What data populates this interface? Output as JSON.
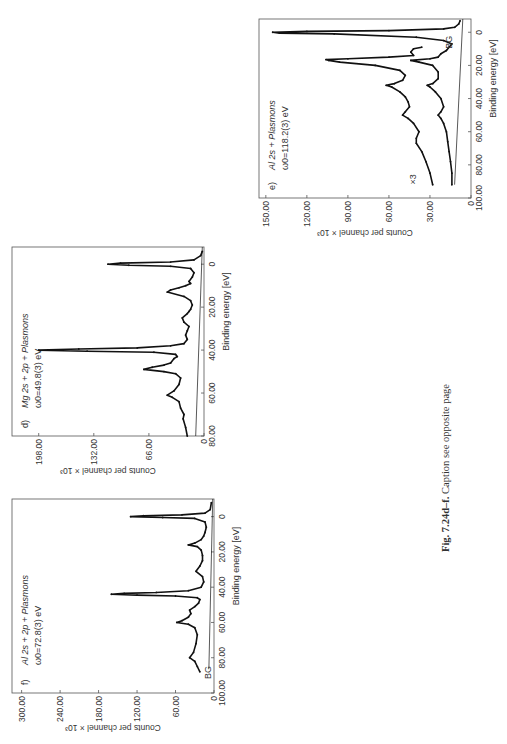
{
  "caption": {
    "prefix": "Fig. 7.24d–f.",
    "text": " Caption see opposite page"
  },
  "chart_data": [
    {
      "id": "d",
      "type": "line",
      "panel_label": "d)",
      "title": "Mg 2s + 2p + Plasmons",
      "subtitle": "ω0=49.8(3) eV",
      "xlabel": "Binding energy [eV]",
      "ylabel": "Counts per channel × 10³",
      "xlim": [
        80,
        -8
      ],
      "ylim": [
        0,
        230
      ],
      "xticks": [
        "80.00",
        "60.00",
        "40.00",
        "20.00",
        "0"
      ],
      "xtick_values": [
        80,
        60,
        40,
        20,
        0
      ],
      "yticks": [
        "0",
        "66.00",
        "132.00",
        "198.00"
      ],
      "ytick_values": [
        0,
        66,
        132,
        198
      ],
      "series": [
        {
          "name": "spectrum",
          "x": [
            80,
            76,
            72,
            70,
            67,
            64,
            62,
            61,
            59,
            56,
            53,
            51,
            50,
            49,
            48,
            47,
            46,
            44,
            43,
            42,
            41,
            40.5,
            40,
            39.5,
            39,
            38,
            37,
            35,
            33,
            31,
            29,
            27,
            25,
            23,
            22,
            21,
            19,
            17,
            15,
            13,
            12,
            11,
            10,
            9,
            8,
            6,
            4,
            2,
            1,
            0.5,
            0,
            -0.5,
            -1,
            -2,
            -4,
            -6
          ],
          "y": [
            20,
            22,
            25,
            24,
            28,
            30,
            38,
            44,
            36,
            30,
            28,
            34,
            48,
            72,
            62,
            48,
            40,
            36,
            32,
            34,
            60,
            140,
            198,
            150,
            80,
            40,
            24,
            20,
            22,
            20,
            18,
            24,
            26,
            20,
            18,
            16,
            14,
            16,
            24,
            44,
            40,
            30,
            22,
            16,
            18,
            14,
            12,
            16,
            40,
            90,
            115,
            100,
            40,
            12,
            4,
            2
          ]
        },
        {
          "name": "background",
          "x": [
            80,
            -8
          ],
          "y": [
            10,
            2
          ]
        }
      ]
    },
    {
      "id": "e",
      "type": "line",
      "panel_label": "e)",
      "title": "Al 2s + Plasmons",
      "subtitle": "ω0=118.2(3) eV",
      "annotations": [
        "×3",
        "BG"
      ],
      "xlabel": "Binding energy [eV]",
      "ylabel": "Counts per channel × 10³",
      "xlim": [
        100,
        -8
      ],
      "ylim": [
        0,
        155
      ],
      "xticks": [
        "100.00",
        "80.00",
        "60.00",
        "40.00",
        "20.00",
        "0"
      ],
      "xtick_values": [
        100,
        80,
        60,
        40,
        20,
        0
      ],
      "yticks": [
        "0",
        "30.00",
        "60.00",
        "90.00",
        "120.00",
        "150.00"
      ],
      "ytick_values": [
        0,
        30,
        60,
        90,
        120,
        150
      ],
      "series": [
        {
          "name": "spectrum ×3",
          "x": [
            92,
            85,
            78,
            72,
            67,
            64,
            60,
            55,
            52,
            50,
            48,
            45,
            42,
            39,
            36,
            33,
            32,
            31,
            29,
            26,
            23,
            20,
            18,
            17,
            16.5,
            16,
            15,
            14,
            12,
            10,
            9
          ],
          "y": [
            28,
            30,
            33,
            36,
            40,
            40,
            38,
            42,
            46,
            50,
            48,
            45,
            46,
            48,
            52,
            58,
            62,
            56,
            50,
            48,
            52,
            70,
            96,
            104,
            106,
            90,
            60,
            42,
            44,
            42,
            36
          ]
        },
        {
          "name": "spectrum",
          "x": [
            92,
            85,
            78,
            72,
            66,
            60,
            55,
            52,
            50,
            48,
            45,
            40,
            36,
            33,
            32,
            31,
            28,
            24,
            20,
            18,
            17,
            16,
            15,
            13,
            11,
            9,
            7,
            5,
            3,
            1,
            0.5,
            0,
            -0.5,
            -1,
            -2,
            -3,
            -5,
            -7
          ],
          "y": [
            14,
            14,
            15,
            16,
            17,
            18,
            20,
            22,
            24,
            22,
            20,
            22,
            26,
            30,
            32,
            28,
            24,
            24,
            28,
            38,
            44,
            30,
            24,
            22,
            18,
            16,
            14,
            20,
            40,
            100,
            140,
            145,
            120,
            60,
            20,
            12,
            9,
            8
          ]
        },
        {
          "name": "background",
          "x": [
            92,
            -8
          ],
          "y": [
            12,
            6
          ]
        }
      ]
    },
    {
      "id": "f",
      "type": "line",
      "panel_label": "f)",
      "title": "Al 2s + 2p + Plasmons",
      "subtitle": "ω0=72.8(3) eV",
      "annotations": [
        "BG"
      ],
      "xlabel": "Binding energy [eV]",
      "ylabel": "Counts per channel × 10³",
      "xlim": [
        100,
        -10
      ],
      "ylim": [
        0,
        315
      ],
      "xticks": [
        "100.00",
        "80.00",
        "60.00",
        "40.00",
        "20.00",
        "0"
      ],
      "xtick_values": [
        100,
        80,
        60,
        40,
        20,
        0
      ],
      "yticks": [
        "0",
        "60.00",
        "120.00",
        "180.00",
        "240.00",
        "300.00"
      ],
      "ytick_values": [
        0,
        60,
        120,
        180,
        240,
        300
      ],
      "series": [
        {
          "name": "spectrum",
          "x": [
            88,
            85,
            82,
            80,
            77,
            72,
            67,
            63,
            61,
            60,
            59,
            57,
            55,
            53,
            51,
            49,
            47,
            46,
            45,
            44.5,
            44,
            43.5,
            43,
            42,
            40,
            37,
            34,
            31,
            28,
            25,
            22,
            19,
            17,
            16,
            15,
            13,
            11,
            9,
            6,
            3,
            1,
            0.5,
            0,
            -0.5,
            -1,
            -2,
            -4,
            -8
          ],
          "y": [
            22,
            26,
            30,
            38,
            32,
            28,
            26,
            30,
            40,
            58,
            50,
            40,
            36,
            38,
            30,
            24,
            22,
            26,
            60,
            120,
            160,
            140,
            90,
            40,
            20,
            16,
            18,
            28,
            22,
            18,
            18,
            20,
            26,
            40,
            30,
            20,
            16,
            14,
            12,
            14,
            30,
            80,
            130,
            110,
            50,
            14,
            6,
            4
          ]
        },
        {
          "name": "background",
          "x": [
            86,
            -10
          ],
          "y": [
            8,
            2
          ]
        }
      ]
    }
  ]
}
